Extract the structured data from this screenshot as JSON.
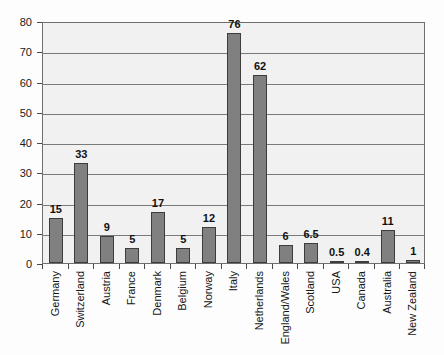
{
  "chart_data": {
    "type": "bar",
    "title": "",
    "xlabel": "",
    "ylabel": "",
    "ylim": [
      0,
      80
    ],
    "ytick_step": 10,
    "yticks": [
      0,
      10,
      20,
      30,
      40,
      50,
      60,
      70,
      80
    ],
    "grid": true,
    "legend": "none",
    "categories": [
      "Germany",
      "Switzerland",
      "Austria",
      "France",
      "Denmark",
      "Belgium",
      "Norway",
      "Italy",
      "Netherlands",
      "England/Wales",
      "Scotland",
      "USA",
      "Canada",
      "Australia",
      "New Zealand"
    ],
    "values": [
      15,
      33,
      9,
      5,
      17,
      5,
      12,
      76,
      62,
      6,
      6.5,
      0.5,
      0.4,
      11,
      1
    ],
    "value_labels": [
      "15",
      "33",
      "9",
      "5",
      "17",
      "5",
      "12",
      "76",
      "62",
      "6",
      "6.5",
      "0.5",
      "0.4",
      "11",
      "1"
    ],
    "colors": {
      "bar_fill": "#808080",
      "bar_outline": "#3d3d3d",
      "plot_background": "#f1f1f1",
      "gridline": "#7a7a7a",
      "axis": "#6f6f6f",
      "text": "#151515"
    }
  }
}
